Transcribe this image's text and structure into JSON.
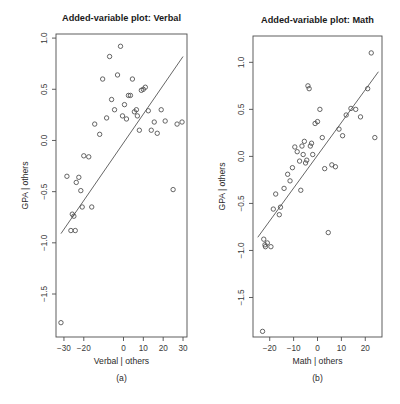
{
  "figure": {
    "caption_a": "(a)",
    "caption_b": "(b)"
  },
  "chart_data": [
    {
      "type": "scatter",
      "title": "Added-variable plot: Verbal",
      "xlabel": "Verbal | others",
      "ylabel": "GPA | others",
      "panel_label": "(a)",
      "xlim": [
        -34,
        32
      ],
      "ylim": [
        -1.92,
        1.04
      ],
      "xticks": [
        -30,
        -20,
        0,
        10,
        20,
        30
      ],
      "xtick_labels": [
        "-30",
        "-20",
        "0",
        "10",
        "20",
        "30"
      ],
      "yticks": [
        -1.5,
        -1.0,
        -0.5,
        0.0,
        0.5,
        1.0
      ],
      "ytick_labels": [
        "-1.5",
        "-1.0",
        "-0.5",
        "0.0",
        "0.5",
        "1.0"
      ],
      "grid": false,
      "legend": "none",
      "fit_line": {
        "x": [
          -31.5,
          30.0
        ],
        "y": [
          -0.91,
          0.82
        ]
      },
      "x": [
        -31.5,
        -28.5,
        -26.5,
        -25.8,
        -25.0,
        -24.3,
        -23.8,
        -22.5,
        -21.5,
        -20.8,
        -20.0,
        -17.5,
        -16.0,
        -14.5,
        -12.0,
        -10.5,
        -8.5,
        -7.0,
        -6.0,
        -4.5,
        -3.0,
        -1.5,
        -0.5,
        0.5,
        1.5,
        2.5,
        3.5,
        4.5,
        5.5,
        6.5,
        7.0,
        8.0,
        9.0,
        10.0,
        11.0,
        12.5,
        14.0,
        15.5,
        17.0,
        19.0,
        21.0,
        25.0,
        27.0,
        29.5
      ],
      "y": [
        -1.78,
        -0.35,
        -0.88,
        -0.72,
        -0.74,
        -0.88,
        -0.41,
        -0.36,
        -0.49,
        -0.65,
        -0.15,
        -0.16,
        -0.65,
        0.16,
        0.06,
        0.6,
        0.22,
        0.82,
        0.4,
        0.3,
        0.64,
        0.92,
        0.24,
        0.35,
        0.21,
        0.44,
        0.44,
        0.6,
        0.28,
        0.3,
        0.24,
        0.1,
        0.49,
        0.5,
        0.52,
        0.29,
        0.1,
        0.18,
        0.07,
        0.3,
        0.19,
        -0.48,
        0.16,
        0.18
      ]
    },
    {
      "type": "scatter",
      "title": "Added-variable plot: Math",
      "xlabel": "Math | others",
      "ylabel": "GPA | others",
      "panel_label": "(b)",
      "xlim": [
        -27,
        27
      ],
      "ylim": [
        -1.92,
        1.28
      ],
      "xticks": [
        -20,
        -10,
        0,
        10,
        20
      ],
      "xtick_labels": [
        "-20",
        "-10",
        "0",
        "10",
        "20"
      ],
      "yticks": [
        -1.5,
        -1.0,
        -0.5,
        0.0,
        0.5,
        1.0
      ],
      "ytick_labels": [
        "-1.5",
        "-1.0",
        "-0.5",
        "0.0",
        "0.5",
        "1.0"
      ],
      "grid": false,
      "legend": "none",
      "fit_line": {
        "x": [
          -25.0,
          25.5
        ],
        "y": [
          -0.86,
          0.9
        ]
      },
      "x": [
        -23.0,
        -22.5,
        -22.0,
        -21.8,
        -21.0,
        -19.5,
        -18.5,
        -17.5,
        -16.0,
        -15.5,
        -14.0,
        -12.5,
        -11.5,
        -10.5,
        -9.5,
        -8.5,
        -7.5,
        -7.0,
        -6.5,
        -6.0,
        -5.5,
        -5.0,
        -4.5,
        -4.0,
        -3.5,
        -3.0,
        -2.5,
        -2.0,
        -1.0,
        0.0,
        1.0,
        2.0,
        3.0,
        4.5,
        6.0,
        7.5,
        9.0,
        10.5,
        12.0,
        14.0,
        16.0,
        18.0,
        21.0,
        22.5,
        24.0
      ],
      "y": [
        -1.86,
        -0.88,
        -0.94,
        -0.96,
        -0.92,
        -0.96,
        -0.56,
        -0.4,
        -0.62,
        -0.54,
        -0.34,
        -0.19,
        -0.26,
        -0.12,
        0.1,
        0.05,
        -0.05,
        -0.36,
        0.11,
        0.02,
        0.16,
        -0.07,
        -0.04,
        0.75,
        0.72,
        0.11,
        0.14,
        0.02,
        0.35,
        0.37,
        0.5,
        0.2,
        -0.13,
        -0.81,
        -0.09,
        -0.11,
        0.29,
        0.22,
        0.44,
        0.51,
        0.5,
        0.42,
        0.72,
        1.1,
        0.2
      ]
    }
  ]
}
